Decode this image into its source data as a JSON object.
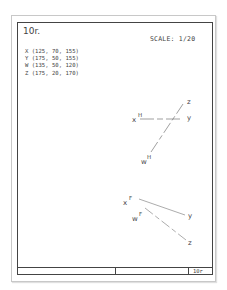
{
  "sheet": {
    "title": "10r.",
    "scale_label": "SCALE: 1/20",
    "title_block_label": "10r"
  },
  "points": [
    {
      "name": "X",
      "text": "X (125, 70, 155)"
    },
    {
      "name": "Y",
      "text": "Y (175, 50, 155)"
    },
    {
      "name": "W",
      "text": "W (135, 50, 120)"
    },
    {
      "name": "Z",
      "text": "Z (175, 20, 170)"
    }
  ],
  "views": {
    "horizontal": {
      "labels": {
        "x": "x",
        "x_sup": "H",
        "y": "y",
        "z": "z",
        "w": "w",
        "w_sup": "H"
      }
    },
    "frontal": {
      "labels": {
        "x": "x",
        "x_sup": "F",
        "y": "y",
        "z": "z",
        "w": "w",
        "w_sup": "F"
      }
    }
  }
}
